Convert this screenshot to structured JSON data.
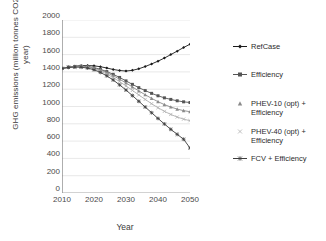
{
  "chart_data": {
    "type": "line",
    "title": "",
    "xlabel": "Year",
    "ylabel": "GHG emissions (million tonnes CO2e per year)",
    "ylabel_line1": "GHG emissions (million tonnes CO2e per",
    "ylabel_line2": "year)",
    "xlim": [
      2010,
      2050
    ],
    "ylim": [
      0,
      2000
    ],
    "ytick_step": 200,
    "grid": "horizontal",
    "legend_position": "right",
    "ytick_labels": [
      "2000",
      "1800",
      "1600",
      "1400",
      "1200",
      "1000",
      "800",
      "600",
      "400",
      "200",
      "0"
    ],
    "xtick_labels": [
      "2010",
      "2020",
      "2030",
      "2040",
      "2050"
    ],
    "x": [
      2010,
      2012,
      2014,
      2016,
      2018,
      2020,
      2022,
      2024,
      2026,
      2028,
      2030,
      2032,
      2034,
      2036,
      2038,
      2040,
      2042,
      2044,
      2046,
      2048,
      2050
    ],
    "series": [
      {
        "name": "RefCase",
        "marker": "diamond",
        "color": "#1a1a1a",
        "values": [
          1440,
          1455,
          1465,
          1472,
          1474,
          1470,
          1460,
          1445,
          1428,
          1416,
          1410,
          1418,
          1436,
          1462,
          1492,
          1524,
          1560,
          1600,
          1640,
          1682,
          1720
        ]
      },
      {
        "name": "Efficiency",
        "marker": "square",
        "color": "#555555",
        "values": [
          1440,
          1455,
          1463,
          1466,
          1462,
          1450,
          1430,
          1404,
          1372,
          1336,
          1296,
          1256,
          1218,
          1184,
          1152,
          1124,
          1100,
          1082,
          1066,
          1054,
          1046
        ]
      },
      {
        "name": "PHEV-10 (opt) + Efficiency",
        "marker": "triangle",
        "color": "#8a8a8a",
        "values": [
          1440,
          1454,
          1461,
          1463,
          1458,
          1444,
          1422,
          1392,
          1356,
          1316,
          1272,
          1226,
          1180,
          1136,
          1094,
          1056,
          1022,
          994,
          970,
          952,
          940
        ]
      },
      {
        "name": "PHEV-40 (opt) + Efficiency",
        "marker": "cross",
        "color": "#b0b0b0",
        "values": [
          1440,
          1453,
          1459,
          1459,
          1452,
          1436,
          1410,
          1376,
          1334,
          1288,
          1238,
          1186,
          1134,
          1082,
          1032,
          986,
          944,
          908,
          878,
          854,
          836
        ]
      },
      {
        "name": "FCV + Efficiency",
        "marker": "star",
        "color": "#3d3d3d",
        "values": [
          1440,
          1452,
          1456,
          1454,
          1444,
          1424,
          1394,
          1354,
          1306,
          1250,
          1190,
          1126,
          1060,
          994,
          928,
          862,
          798,
          736,
          678,
          622,
          520
        ]
      }
    ]
  },
  "legend": {
    "items": [
      {
        "label": "RefCase",
        "marker": "diamond",
        "color": "#1a1a1a",
        "show_line": true
      },
      {
        "label": "Efficiency",
        "marker": "square",
        "color": "#555555",
        "show_line": true
      },
      {
        "label": "PHEV-10 (opt) +\nEfficiency",
        "marker": "triangle",
        "color": "#8a8a8a",
        "show_line": false
      },
      {
        "label": "PHEV-40 (opt) +\nEfficiency",
        "marker": "cross",
        "color": "#b0b0b0",
        "show_line": false
      },
      {
        "label": "FCV + Efficiency",
        "marker": "star",
        "color": "#3d3d3d",
        "show_line": true
      }
    ]
  },
  "colors": {
    "background": "#ffffff",
    "gridline": "#d9d9d9",
    "axis": "#9a9a9a",
    "text": "#3a3a3a"
  }
}
